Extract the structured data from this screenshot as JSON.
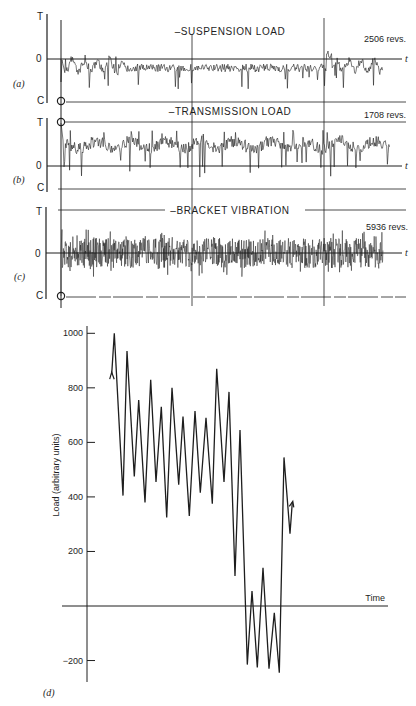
{
  "strip_panels": [
    {
      "id": "a",
      "panel_label": "(a)",
      "title": "–SUSPENSION LOAD",
      "revs": "2506 revs.",
      "axis_top": "T",
      "axis_zero": "0",
      "axis_bottom": "C",
      "time_label": "t",
      "signal_kind": "suspension"
    },
    {
      "id": "b",
      "panel_label": "(b)",
      "title": "–TRANSMISSION LOAD",
      "revs": "1708 revs.",
      "axis_top": "T",
      "axis_zero": "0",
      "axis_bottom": "C",
      "time_label": "t",
      "signal_kind": "transmission"
    },
    {
      "id": "c",
      "panel_label": "(c)",
      "title": "–BRACKET VIBRATION",
      "revs": "5936 revs.",
      "axis_top": "T",
      "axis_zero": "0",
      "axis_bottom": "C",
      "time_label": "t",
      "signal_kind": "vibration"
    }
  ],
  "colors": {
    "ink": "#1e1e1e",
    "background": "#ffffff"
  },
  "chart_data": {
    "type": "line",
    "panel_label": "(d)",
    "title": "",
    "xlabel": "Time",
    "ylabel": "Load (arbitrary units)",
    "ylim": [
      -300,
      1000
    ],
    "yticks": [
      1000,
      800,
      600,
      400,
      200,
      -200
    ],
    "ytick_labels": [
      "1000",
      "800",
      "600",
      "400",
      "200",
      "−200"
    ],
    "grid": false,
    "legend": "none",
    "start_arrow": true,
    "end_arrow": true,
    "series": [
      {
        "name": "load history",
        "values": [
          850,
          1000,
          405,
          935,
          475,
          755,
          380,
          830,
          455,
          730,
          325,
          800,
          445,
          695,
          330,
          715,
          415,
          690,
          375,
          870,
          455,
          785,
          110,
          645,
          -215,
          55,
          -225,
          140,
          -230,
          -25,
          -245,
          545,
          265,
          380
        ]
      }
    ]
  }
}
